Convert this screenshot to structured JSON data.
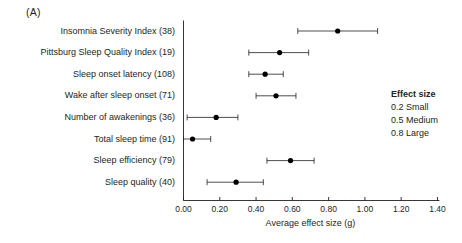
{
  "panel": {
    "label": "(A)"
  },
  "axis": {
    "x_title": "Average effect size (g)",
    "ticks": [
      "0.00",
      "0.20",
      "0.40",
      "0.60",
      "0.80",
      "1.00",
      "1.20",
      "1.40"
    ]
  },
  "legend": {
    "title": "Effect size",
    "items": [
      "0.2 Small",
      "0.5 Medium",
      "0.8 Large"
    ]
  },
  "chart_data": {
    "type": "scatter",
    "title": "",
    "xlabel": "Average effect size (g)",
    "ylabel": "",
    "xlim": [
      0.0,
      1.4
    ],
    "xticks": [
      0.0,
      0.2,
      0.4,
      0.6,
      0.8,
      1.0,
      1.2,
      1.4
    ],
    "grid": false,
    "legend_position": "right",
    "categories": [
      "Insomnia Severity Index (38)",
      "Pittsburg Sleep Quality Index (19)",
      "Sleep onset latency (108)",
      "Wake after sleep onset (71)",
      "Number of awakenings (36)",
      "Total sleep time (91)",
      "Sleep efficiency (79)",
      "Sleep quality (40)"
    ],
    "values": [
      0.85,
      0.53,
      0.45,
      0.51,
      0.18,
      0.05,
      0.59,
      0.29
    ],
    "ci_low": [
      0.63,
      0.36,
      0.36,
      0.4,
      0.02,
      0.0,
      0.46,
      0.13
    ],
    "ci_high": [
      1.07,
      0.69,
      0.55,
      0.62,
      0.3,
      0.15,
      0.72,
      0.44
    ],
    "points": [
      {
        "label": "Insomnia Severity Index (38)",
        "n": 38,
        "effect": 0.85,
        "ci": [
          0.63,
          1.07
        ]
      },
      {
        "label": "Pittsburg Sleep Quality Index (19)",
        "n": 19,
        "effect": 0.53,
        "ci": [
          0.36,
          0.69
        ]
      },
      {
        "label": "Sleep onset latency (108)",
        "n": 108,
        "effect": 0.45,
        "ci": [
          0.36,
          0.55
        ]
      },
      {
        "label": "Wake after sleep onset (71)",
        "n": 71,
        "effect": 0.51,
        "ci": [
          0.4,
          0.62
        ]
      },
      {
        "label": "Number of awakenings (36)",
        "n": 36,
        "effect": 0.18,
        "ci": [
          0.02,
          0.3
        ]
      },
      {
        "label": "Total sleep time (91)",
        "n": 91,
        "effect": 0.05,
        "ci": [
          0.0,
          0.15
        ]
      },
      {
        "label": "Sleep efficiency (79)",
        "n": 79,
        "effect": 0.59,
        "ci": [
          0.46,
          0.72
        ]
      },
      {
        "label": "Sleep quality (40)",
        "n": 40,
        "effect": 0.29,
        "ci": [
          0.13,
          0.44
        ]
      }
    ]
  }
}
